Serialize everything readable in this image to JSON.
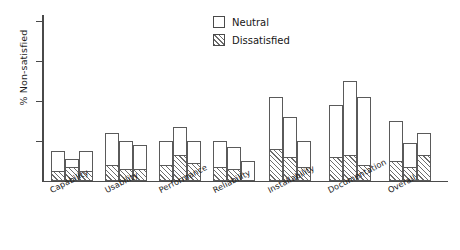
{
  "chart_data": {
    "type": "bar",
    "title": "",
    "subtitle": "",
    "xlabel": "",
    "ylabel": "% Non-satisfied",
    "stacked": true,
    "grid": false,
    "ylim": [
      0,
      41.5
    ],
    "y_ticks": [
      10,
      20,
      30,
      40
    ],
    "y_tick_labels": [
      "",
      "",
      "",
      ""
    ],
    "legend_position": "top-center",
    "categories": [
      "Capability",
      "Usability",
      "Performance",
      "Reliability",
      "Installability",
      "Documentation",
      "Overall"
    ],
    "series": [
      {
        "name": "Dissatisfied",
        "pattern": "hatched",
        "values": [
          [
            2.5,
            3.5,
            2.5
          ],
          [
            4.0,
            3.0,
            3.0
          ],
          [
            4.0,
            6.5,
            4.5
          ],
          [
            3.5,
            3.0,
            0.0
          ],
          [
            8.0,
            6.0,
            3.5
          ],
          [
            6.0,
            6.5,
            4.0
          ],
          [
            5.0,
            3.5,
            6.5
          ]
        ]
      },
      {
        "name": "Neutral",
        "pattern": "solid-white",
        "values": [
          [
            5.0,
            2.0,
            5.0
          ],
          [
            8.0,
            7.0,
            6.0
          ],
          [
            6.0,
            7.0,
            5.5
          ],
          [
            6.5,
            5.5,
            5.0
          ],
          [
            13.0,
            10.0,
            6.5
          ],
          [
            13.0,
            18.5,
            17.0
          ],
          [
            10.0,
            6.0,
            5.5
          ]
        ]
      }
    ],
    "group_totals": [
      [
        7.5,
        5.5,
        7.5
      ],
      [
        12.0,
        10.0,
        9.0
      ],
      [
        10.0,
        13.5,
        10.0
      ],
      [
        10.0,
        8.5,
        5.0
      ],
      [
        21.0,
        16.0,
        10.0
      ],
      [
        19.0,
        25.0,
        21.0
      ],
      [
        15.0,
        9.5,
        12.0
      ]
    ],
    "bars_per_group": 3
  },
  "legend": {
    "items": [
      {
        "label": "Neutral",
        "swatch": "neutral"
      },
      {
        "label": "Dissatisfied",
        "swatch": "dissatisfied"
      }
    ]
  },
  "colors": {
    "axis": "#4a4a4a",
    "bar_outline": "#5a5a5a",
    "hatch": "#6d6d6d",
    "background": "#ffffff",
    "text": "#1d1d1d"
  }
}
